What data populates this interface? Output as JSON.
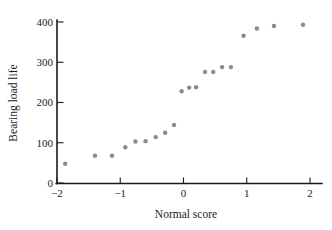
{
  "figure": {
    "width": 332,
    "height": 230,
    "background": "#ffffff",
    "point_color": "#8a8a8f",
    "axis_color": "#1b1b1b"
  },
  "chart_data": {
    "type": "scatter",
    "title": "",
    "xlabel": "Normal score",
    "ylabel": "Bearing load life",
    "xlim": [
      -2.2,
      2.2
    ],
    "ylim": [
      0,
      420
    ],
    "xticks": [
      -2,
      -1,
      0,
      1,
      2
    ],
    "xticklabels": [
      "−2",
      "−1",
      "0",
      "1",
      "2"
    ],
    "yticks": [
      0,
      100,
      200,
      300,
      400
    ],
    "yticklabels": [
      "0",
      "100",
      "200",
      "300",
      "400"
    ],
    "grid": false,
    "legend": null,
    "marker": "circle",
    "marker_size": 2.2,
    "points": [
      {
        "x": -1.87,
        "y": 48
      },
      {
        "x": -1.4,
        "y": 68
      },
      {
        "x": -1.13,
        "y": 68
      },
      {
        "x": -0.92,
        "y": 89
      },
      {
        "x": -0.76,
        "y": 103
      },
      {
        "x": -0.6,
        "y": 104
      },
      {
        "x": -0.44,
        "y": 114
      },
      {
        "x": -0.29,
        "y": 125
      },
      {
        "x": -0.15,
        "y": 144
      },
      {
        "x": -0.03,
        "y": 228
      },
      {
        "x": 0.09,
        "y": 237
      },
      {
        "x": 0.2,
        "y": 238
      },
      {
        "x": 0.34,
        "y": 276
      },
      {
        "x": 0.47,
        "y": 276
      },
      {
        "x": 0.61,
        "y": 288
      },
      {
        "x": 0.75,
        "y": 288
      },
      {
        "x": 0.95,
        "y": 366
      },
      {
        "x": 1.16,
        "y": 384
      },
      {
        "x": 1.43,
        "y": 390
      },
      {
        "x": 1.89,
        "y": 393
      }
    ]
  },
  "axes_geometry": {
    "x_origin_px": 57,
    "y_origin_px": 183,
    "x_right_px": 310,
    "y_top_px": 22,
    "px_per_x_unit": 63.25,
    "px_per_y_unit": 0.4025
  }
}
